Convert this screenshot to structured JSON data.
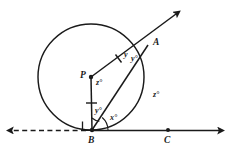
{
  "figure": {
    "type": "circle-tangent-geometry-diagram",
    "colors": {
      "stroke": "#1a1a1a",
      "background": "#ffffff"
    },
    "points": {
      "P": {
        "label": "P",
        "x": 91,
        "y": 77,
        "role": "circle-center"
      },
      "A": {
        "label": "A",
        "x": 148,
        "y": 45,
        "role": "point-on-circle"
      },
      "B": {
        "label": "B",
        "x": 92,
        "y": 130,
        "role": "tangent-point"
      },
      "C": {
        "label": "C",
        "x": 168,
        "y": 130,
        "role": "point-on-tangent-line"
      }
    },
    "circle": {
      "center_x": 91,
      "center_y": 77,
      "radius": 53
    },
    "angle_labels": [
      {
        "name": "angle-at-P",
        "text": "z°",
        "x": 96,
        "y": 79
      },
      {
        "name": "angle-at-A",
        "text": "y°",
        "x": 131,
        "y": 57
      },
      {
        "name": "angle-PBA",
        "text": "y°",
        "x": 95,
        "y": 110
      },
      {
        "name": "angle-ABC",
        "text": "x°",
        "x": 110,
        "y": 116
      },
      {
        "name": "arc-angle-right",
        "text": "z°",
        "x": 154,
        "y": 94
      }
    ],
    "segment_labels": [
      {
        "name": "segment-PA-label",
        "text": "y",
        "x": 118,
        "y": 55
      }
    ],
    "markers": {
      "right_angle": {
        "name": "right-angle-at-B",
        "present": true
      },
      "tick_marks": {
        "name": "congruent-radius-ticks",
        "count": 2
      }
    },
    "rays": {
      "tangent_right": {
        "name": "ray-BC",
        "style": "solid",
        "arrow": true
      },
      "tangent_left": {
        "name": "ray-B-left",
        "style": "dashed",
        "arrow": true
      },
      "secant_PA": {
        "name": "ray-PA",
        "style": "solid",
        "arrow": true
      }
    }
  }
}
